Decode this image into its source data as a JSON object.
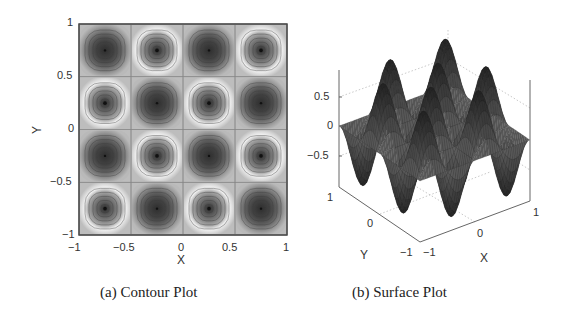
{
  "figure": {
    "captions": {
      "a": "(a) Contour Plot",
      "b": "(b) Surface Plot"
    }
  },
  "chart_data": [
    {
      "type": "heatmap",
      "subtype": "contour",
      "title": "(a) Contour Plot",
      "xlabel": "X",
      "ylabel": "Y",
      "xlim": [
        -1,
        1
      ],
      "ylim": [
        -1,
        1
      ],
      "xticks": [
        "−1",
        "−0.5",
        "0",
        "0.5",
        "1"
      ],
      "yticks": [
        "1",
        "0.5",
        "0",
        "−0.5",
        "−1"
      ],
      "grid": false,
      "function_shape": "sin(2πx)·sin(2πy)-like, 4×4 alternating extrema",
      "cells_rows_top_to_bottom": [
        [
          "dark",
          "light-ring",
          "dark",
          "light-ring"
        ],
        [
          "light-ring",
          "dark",
          "light-ring",
          "dark"
        ],
        [
          "dark",
          "light-ring",
          "dark",
          "light-ring"
        ],
        [
          "light-ring",
          "dark",
          "light-ring",
          "dark"
        ]
      ],
      "cell_centers": [
        -0.75,
        -0.25,
        0.25,
        0.75
      ]
    },
    {
      "type": "surface",
      "title": "(b) Surface Plot",
      "xlabel": "X",
      "ylabel": "Y",
      "zlabel": "",
      "xlim": [
        -1,
        1
      ],
      "ylim": [
        -1,
        1
      ],
      "zlim": [
        -1,
        1
      ],
      "xticks": [
        "−1",
        "0",
        "1"
      ],
      "yticks": [
        "−1",
        "0",
        "1"
      ],
      "zticks": [
        "0.5",
        "0",
        "−0.5"
      ],
      "grid": true,
      "function_shape": "oscillating 4×4 peaks and valleys, amplitude ≈1"
    }
  ],
  "contour": {
    "xticks": [
      "−1",
      "−0.5",
      "0",
      "0.5",
      "1"
    ],
    "yticks": [
      "1",
      "0.5",
      "0",
      "−0.5",
      "−1"
    ],
    "xlabel": "X",
    "ylabel": "Y"
  },
  "surface": {
    "zticks": [
      "0.5",
      "0",
      "−0.5"
    ],
    "yticks": [
      "1",
      "0",
      "−1"
    ],
    "xticks": [
      "−1",
      "0",
      "1"
    ],
    "xlabel": "X",
    "ylabel": "Y"
  },
  "colors": {
    "background": "#ffffff",
    "cell_base": "#bdbdbd",
    "dark_core": "#3a3a3a",
    "light_ring": "#f2f2f2",
    "surface_dark": "#1e1e1e",
    "surface_mid": "#6a6a6a"
  }
}
